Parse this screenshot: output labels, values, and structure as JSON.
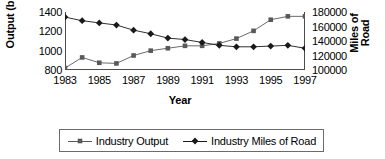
{
  "chart_data": {
    "type": "line",
    "title": "",
    "xlabel": "Year",
    "ylabel": "Output (bil)",
    "ylabel_right_line1": "Miles of",
    "ylabel_right_line2": "Road",
    "grid": false,
    "legend_position": "bottom",
    "x": [
      1983,
      1984,
      1985,
      1986,
      1987,
      1988,
      1989,
      1990,
      1991,
      1992,
      1993,
      1994,
      1995,
      1996,
      1997
    ],
    "xticklabels": [
      "1983",
      "1985",
      "1987",
      "1989",
      "1991",
      "1993",
      "1995",
      "1997"
    ],
    "xtickvalues": [
      1983,
      1985,
      1987,
      1989,
      1991,
      1993,
      1995,
      1997
    ],
    "xlim": [
      1983,
      1997
    ],
    "ylim": [
      800,
      1400
    ],
    "yticklabels": [
      "1400",
      "1200",
      "1000",
      "800"
    ],
    "ytickvalues": [
      1400,
      1200,
      1000,
      800
    ],
    "ylim_right": [
      100000,
      180000
    ],
    "yticklabels_right": [
      "180000",
      "160000",
      "140000",
      "120000",
      "100000"
    ],
    "ytickvalues_right": [
      180000,
      160000,
      140000,
      120000,
      100000
    ],
    "series": [
      {
        "name": "Industry Output",
        "axis": "left",
        "marker": "square",
        "color": "#595959",
        "values": [
          820,
          930,
          875,
          868,
          950,
          1000,
          1025,
          1050,
          1050,
          1075,
          1125,
          1205,
          1320,
          1355,
          1355
        ]
      },
      {
        "name": "Industry Miles of Road",
        "axis": "right",
        "marker": "diamond",
        "color": "#1a1a1a",
        "values": [
          173000,
          168000,
          165000,
          162000,
          155000,
          150000,
          144000,
          142000,
          138000,
          134000,
          132000,
          132000,
          133000,
          134000,
          130000
        ]
      }
    ],
    "legend": [
      {
        "label": "Industry Output",
        "marker": "square"
      },
      {
        "label": "Industry Miles of Road",
        "marker": "diamond"
      }
    ]
  }
}
